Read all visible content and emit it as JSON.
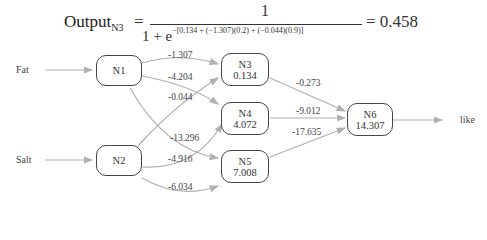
{
  "formula": {
    "lhs": "Output",
    "lhs_sub": "N3",
    "equals": "=",
    "numerator": "1",
    "denominator_prefix": "1 + e",
    "exponent": "−[0.134 + (−1.307)(0.2) + (−0.044)(0.9)]",
    "result": "= 0.458"
  },
  "inputs": [
    {
      "label": "Fat"
    },
    {
      "label": "Salt"
    }
  ],
  "output": {
    "label": "like"
  },
  "nodes": [
    {
      "id": "N1",
      "label": "N1",
      "value": ""
    },
    {
      "id": "N2",
      "label": "N2",
      "value": ""
    },
    {
      "id": "N3",
      "label": "N3",
      "value": "0.134"
    },
    {
      "id": "N4",
      "label": "N4",
      "value": "4.072"
    },
    {
      "id": "N5",
      "label": "N5",
      "value": "7.008"
    },
    {
      "id": "N6",
      "label": "N6",
      "value": "14.307"
    }
  ],
  "weights": {
    "n1_n3": "-1.307",
    "n1_n4": "-4.204",
    "n2_n3": "-0.044",
    "n1_n5": "-13.296",
    "n2_n4": "-4.916",
    "n2_n5": "-6.034",
    "n3_n6": "-0.273",
    "n4_n6": "-9.012",
    "n5_n6": "-17.635"
  },
  "colors": {
    "edge": "#b0b0b0",
    "node_border": "#444444"
  }
}
